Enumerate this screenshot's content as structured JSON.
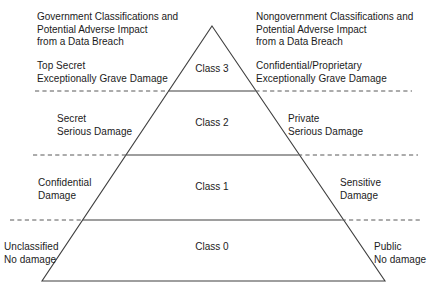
{
  "diagram": {
    "title_left": "Government Classifications and\nPotential Adverse Impact\nfrom a Data Breach",
    "title_right": "Nongovernment Classifications and\nPotential Adverse Impact\nfrom a Data Breach",
    "levels": [
      {
        "class_label": "Class 3",
        "left_label": "Top Secret\nExceptionally Grave Damage",
        "right_label": "Confidential/Proprietary\nExceptionally Grave Damage"
      },
      {
        "class_label": "Class 2",
        "left_label": "Secret\nSerious Damage",
        "right_label": "Private\nSerious Damage"
      },
      {
        "class_label": "Class 1",
        "left_label": "Confidential\nDamage",
        "right_label": "Sensitive\nDamage"
      },
      {
        "class_label": "Class 0",
        "left_label": "Unclassified\nNo damage",
        "right_label": "Public\nNo damage"
      }
    ],
    "colors": {
      "stroke": "#3f3f3f",
      "text": "#1b1b1b",
      "background": "#ffffff"
    }
  }
}
